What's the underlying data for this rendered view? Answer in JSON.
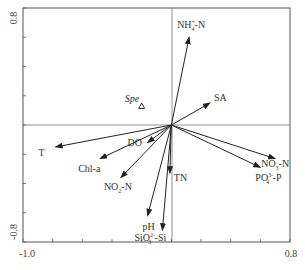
{
  "chart_data": {
    "type": "scatter",
    "subtype": "biplot (RDA/CCA ordination)",
    "title": "",
    "xlabel": "",
    "ylabel": "",
    "xlim": [
      -1.0,
      0.8
    ],
    "ylim": [
      -0.8,
      0.8
    ],
    "x_tick_labels": [
      "-1.0",
      "0.8"
    ],
    "y_tick_labels": [
      "0.8",
      "-0.8"
    ],
    "tick_step": 0.2,
    "grid": false,
    "legend": null,
    "reference_lines": {
      "x": 0,
      "y": 0
    },
    "vectors": [
      {
        "name": "NH4+-N",
        "label_main": "NH",
        "label_sub": "4",
        "label_sup": "+",
        "label_tail": "-N",
        "x": 0.12,
        "y": 0.6
      },
      {
        "name": "SA",
        "label_main": "SA",
        "x": 0.26,
        "y": 0.15
      },
      {
        "name": "T",
        "label_main": "T",
        "x": -0.78,
        "y": -0.15
      },
      {
        "name": "Chl-a",
        "label_main": "Chl-a",
        "x": -0.48,
        "y": -0.23
      },
      {
        "name": "DO",
        "label_main": "DO",
        "x": -0.16,
        "y": -0.12
      },
      {
        "name": "NO2--N",
        "label_main": "NO",
        "label_sub": "2",
        "label_tail": "-N",
        "x": -0.34,
        "y": -0.36
      },
      {
        "name": "TN",
        "label_main": "TN",
        "x": -0.01,
        "y": -0.33
      },
      {
        "name": "pH",
        "label_main": "pH",
        "x": -0.16,
        "y": -0.62
      },
      {
        "name": "SiO3 2--Si",
        "label_main": "SiO",
        "label_sub": "3",
        "label_sup": "2-",
        "label_tail": "-Si",
        "x": -0.06,
        "y": -0.72
      },
      {
        "name": "NO3--N",
        "label_main": "NO",
        "label_sub": "3",
        "label_tail": "-N",
        "x": 0.7,
        "y": -0.23
      },
      {
        "name": "PO4 3--P",
        "label_main": "PO",
        "label_sub": "4",
        "label_sup": "3-",
        "label_tail": "-P",
        "x": 0.6,
        "y": -0.29
      }
    ],
    "points": [
      {
        "name": "Spe",
        "marker": "triangle-open",
        "x": -0.2,
        "y": 0.13
      }
    ]
  }
}
